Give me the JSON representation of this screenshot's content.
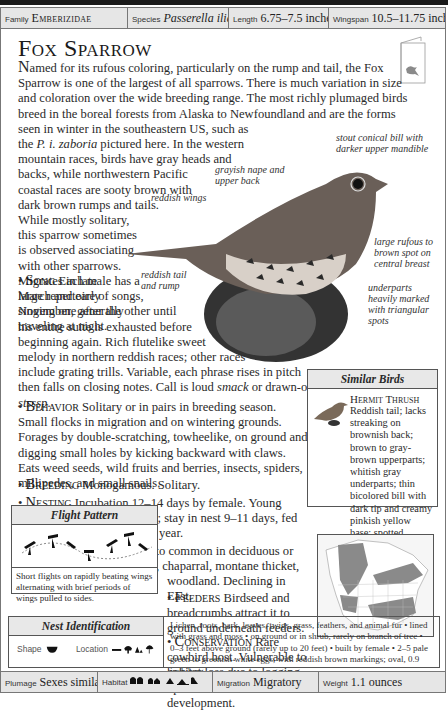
{
  "header": {
    "family_label": "Family",
    "family_value": "Emberizidae",
    "species_label": "Species",
    "species_value": "Passerella iliaca",
    "length_label": "Length",
    "length_value": "6.75–7.5 inches",
    "wingspan_label": "Wingspan",
    "wingspan_value": "10.5–11.75 inches"
  },
  "title": "Fox Sparrow",
  "intro": {
    "p1": "Named for its rufous coloring, particularly on the rump and tail, the Fox Sparrow is one of the largest of all sparrows. There is much variation in size and coloration over the wide breeding range. The most richly plumaged birds breed in the boreal forests from Alaska to Newfoundland and are the forms seen in winter in the southeastern US, such as",
    "p1b_pre": "the ",
    "p1b_italic": "P. i. zaboria",
    "p1b_post": " pictured here. In the western",
    "lines": [
      "mountain races, birds have gray heads and",
      "backs, while northwestern Pacific",
      "coastal races are sooty brown with",
      "dark brown rumps and tails.",
      "While mostly solitary,",
      "this sparrow sometimes",
      "is observed associating",
      "with other sparrows.",
      "Migrates in late",
      "March and early",
      "November, generally",
      "traveling at night."
    ]
  },
  "annotations": {
    "bill": "stout conical bill with darker upper mandible",
    "nape": "grayish nape and upper back",
    "wings": "reddish wings",
    "tail": "reddish tail and rump",
    "breast": "large rufous to brown spot on central breast",
    "underparts": "underparts heavily marked with triangular spots"
  },
  "sections": {
    "song_title": "Song",
    "song_lines": [
      "Each male has a",
      "large repertoire of songs,",
      "singing one after the other until",
      "his entire suite is exhausted before",
      "beginning again. Rich flutelike sweet",
      "melody in northern reddish races; other races",
      "include grating trills. Variable, each phrase rises in pitch"
    ],
    "song_last_pre": "then falls on closing notes. Call is loud ",
    "song_call1": "smack",
    "song_mid": " or drawn-out ",
    "song_call2": "stsssp",
    "song_end": ".",
    "behavior_title": "Behavior",
    "behavior_text": "Solitary or in pairs in breeding season. Small flocks in migration and on wintering grounds. Forages by double-scratching, towheelike, on ground and digging small holes by kicking backward with claws. Eats weed seeds, wild fruits and berries, insects, spiders, millipedes, and small snails.",
    "breeding_title": "Breeding",
    "breeding_text": "Monogamous. Solitary.",
    "nesting_title": "Nesting",
    "nesting_text": "Incubation 12–14 days by female. Young altricial; brooded by female; stay in nest 9–11 days, fed by both sexes. 2 broods per year.",
    "population_title": "Population",
    "population_text": "Uncommon to common in deciduous or conifer forest, undergrowth, chaparral, montane thicket, and riparian",
    "population_text2": "woodland. Declining in East.",
    "feeders_title": "Feeders",
    "feeders_text": "Birdseed and breadcrumbs attract it to ground underneath feeders.",
    "conservation_title": "Conservation",
    "conservation_text": "Rare cowbird host. Vulnerable to habitat loss due to logging operations and development."
  },
  "similar_birds": {
    "header": "Similar Birds",
    "name": "Hermit Thrush",
    "description": "Reddish tail; lacks streaking on brownish back; brown to gray-brown upperparts; whitish gray underparts; thin bicolored bill with dark tip and creamy pinkish yellow base; spotted breast, sides, and flanks."
  },
  "flight_pattern": {
    "header": "Flight Pattern",
    "caption": "Short flights on rapidly beating wings alternating with brief periods of wings pulled to sides."
  },
  "nest": {
    "header": "Nest Identification",
    "shape_label": "Shape",
    "location_label": "Location",
    "description": "Lichen, roots, bark, leaves, twigs, grass, feathers, and animal fur • lined with grass and moss • on ground or in shrub, rarely on branch of tree • 0–3 feet above ground (rarely up to 20 feet) • built by female • 2–5 pale green to greenish white eggs, with reddish brown markings; oval, 0.9 inch long."
  },
  "footer": {
    "plumage_label": "Plumage",
    "plumage_value": "Sexes similar",
    "habitat_label": "Habitat",
    "migration_label": "Migration",
    "migration_value": "Migratory",
    "weight_label": "Weight",
    "weight_value": "1.1 ounces"
  },
  "colors": {
    "bar": "#e6e6e6",
    "border": "#777777",
    "map_range": "#8a8a8a"
  }
}
